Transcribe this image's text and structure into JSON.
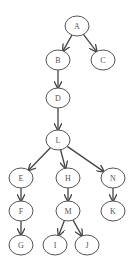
{
  "diagram": {
    "type": "directed-tree",
    "background": "#ffffff",
    "node_stroke": "#555555",
    "edge_stroke": "#444444",
    "nodes": [
      {
        "id": "A",
        "label": "A",
        "x": 77,
        "y": 26
      },
      {
        "id": "B",
        "label": "B",
        "x": 58,
        "y": 60
      },
      {
        "id": "C",
        "label": "C",
        "x": 103,
        "y": 60
      },
      {
        "id": "D",
        "label": "D",
        "x": 58,
        "y": 98
      },
      {
        "id": "L",
        "label": "L",
        "x": 58,
        "y": 140
      },
      {
        "id": "E",
        "label": "E",
        "x": 21,
        "y": 178
      },
      {
        "id": "H",
        "label": "H",
        "x": 68,
        "y": 178
      },
      {
        "id": "N",
        "label": "N",
        "x": 113,
        "y": 178
      },
      {
        "id": "F",
        "label": "F",
        "x": 21,
        "y": 211
      },
      {
        "id": "M",
        "label": "M",
        "x": 68,
        "y": 211
      },
      {
        "id": "K",
        "label": "K",
        "x": 113,
        "y": 211
      },
      {
        "id": "G",
        "label": "G",
        "x": 21,
        "y": 245
      },
      {
        "id": "I",
        "label": "I",
        "x": 55,
        "y": 245
      },
      {
        "id": "J",
        "label": "J",
        "x": 87,
        "y": 245
      }
    ],
    "edges": [
      {
        "from": "A",
        "to": "B"
      },
      {
        "from": "A",
        "to": "C"
      },
      {
        "from": "B",
        "to": "D"
      },
      {
        "from": "D",
        "to": "L"
      },
      {
        "from": "L",
        "to": "E"
      },
      {
        "from": "L",
        "to": "H"
      },
      {
        "from": "L",
        "to": "N"
      },
      {
        "from": "E",
        "to": "F"
      },
      {
        "from": "F",
        "to": "G"
      },
      {
        "from": "H",
        "to": "M"
      },
      {
        "from": "M",
        "to": "I"
      },
      {
        "from": "M",
        "to": "J"
      },
      {
        "from": "N",
        "to": "K"
      }
    ]
  }
}
